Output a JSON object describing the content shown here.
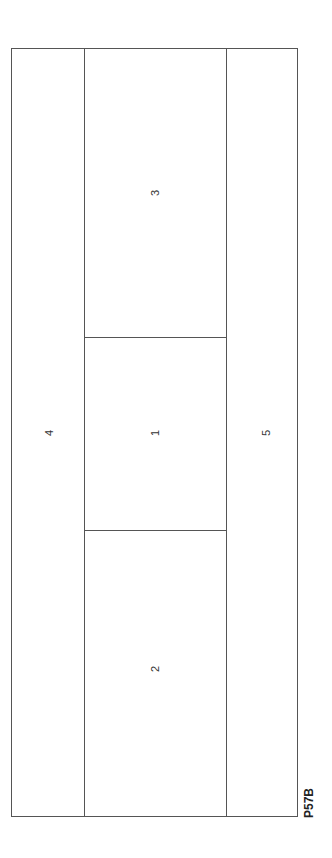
{
  "diagram": {
    "code": "P57B",
    "regions": [
      {
        "id": "1",
        "label": "1",
        "position": "center"
      },
      {
        "id": "2",
        "label": "2",
        "position": "center-bottom"
      },
      {
        "id": "3",
        "label": "3",
        "position": "center-top"
      },
      {
        "id": "4",
        "label": "4",
        "position": "left-strip"
      },
      {
        "id": "5",
        "label": "5",
        "position": "right-strip"
      }
    ],
    "line_color": "#555555"
  }
}
